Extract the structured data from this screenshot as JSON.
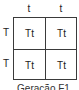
{
  "punnett": {
    "columns": [
      "t",
      "t"
    ],
    "rows": [
      "T",
      "T"
    ],
    "cells": [
      [
        "Tt",
        "Tt"
      ],
      [
        "Tt",
        "Tt"
      ]
    ],
    "caption": "Geração F1"
  },
  "colors": {
    "line": "#3a3a3a",
    "text": "#222222",
    "background": "#ffffff"
  }
}
